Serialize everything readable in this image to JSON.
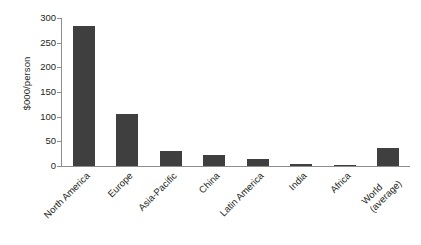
{
  "chart_data": {
    "type": "bar",
    "title": "",
    "xlabel": "",
    "ylabel": "$000/person",
    "ylim": [
      0,
      300
    ],
    "yticks": [
      0,
      50,
      100,
      150,
      200,
      250,
      300
    ],
    "ytick_labels": [
      "0",
      "50",
      "100",
      "150",
      "200",
      "250",
      "300"
    ],
    "grid": false,
    "legend": false,
    "bar_color": "#3f3f3f",
    "axis_color": "#8d8d8d",
    "text_color": "#231f20",
    "categories": [
      "North America",
      "Europe",
      "Asia-Pacific",
      "China",
      "Latin America",
      "India",
      "Africa",
      "World\n(average)"
    ],
    "category_labels_line1": [
      "North America",
      "Europe",
      "Asia-Pacific",
      "China",
      "Latin America",
      "India",
      "Africa",
      "World"
    ],
    "category_labels_line2": [
      "",
      "",
      "",
      "",
      "",
      "",
      "",
      "(average)"
    ],
    "values": [
      283,
      105,
      30,
      22,
      14,
      4,
      3,
      37
    ]
  }
}
